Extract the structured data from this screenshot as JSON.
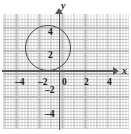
{
  "chart_data": {
    "type": "scatter",
    "title": "",
    "subtitle": "",
    "xlabel": "x",
    "ylabel": "y",
    "xlim": [
      -5,
      5
    ],
    "ylim": [
      -5,
      5
    ],
    "grid": true,
    "minor_grid": true,
    "legend": "none",
    "x_ticks": [
      {
        "value": -4,
        "label": "–4",
        "px": 15,
        "py": 78
      },
      {
        "value": -2,
        "label": "–2",
        "px": 38,
        "py": 78
      },
      {
        "value": 0,
        "label": "0",
        "px": 62,
        "py": 78
      },
      {
        "value": 2,
        "label": "2",
        "px": 84,
        "py": 78
      },
      {
        "value": 4,
        "label": "4",
        "px": 107,
        "py": 78
      }
    ],
    "y_ticks": [
      {
        "value": 4,
        "label": "4",
        "px": 48,
        "py": 28
      },
      {
        "value": 2,
        "label": "2",
        "px": 48,
        "py": 51
      },
      {
        "value": -2,
        "label": "–2",
        "px": 45,
        "py": 86
      },
      {
        "value": -4,
        "label": "–4",
        "px": 45,
        "py": 110
      }
    ],
    "series": [
      {
        "name": "circle",
        "shape": "circle",
        "center": [
          -1,
          2
        ],
        "radius": 2,
        "equation": "(x + 1)^2 + (y - 2)^2 = 4",
        "stroke": "#4a4a50",
        "fill": "none"
      }
    ],
    "annotations": [],
    "colors": {
      "curve": "#4a4a50",
      "axis": "#58585c",
      "major_grid": "#b9b9b9",
      "minor_grid": "#969696",
      "tick_text": "#1e1e22",
      "background": "#ffffff"
    }
  }
}
